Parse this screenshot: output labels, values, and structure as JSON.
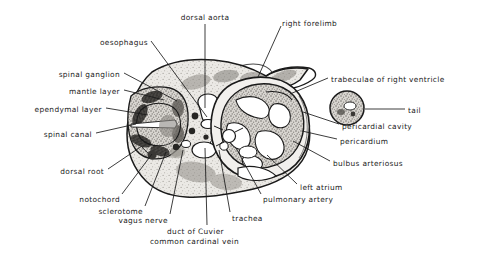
{
  "figure": {
    "kind": "histological cross-section micrograph",
    "background_color": "#ffffff",
    "ink_color": "#1a1a1a",
    "specimen_fill": "#e8e6e2",
    "dark_tissue_color": "#2a2a2a"
  },
  "labels": [
    {
      "id": "dorsal-aorta",
      "text": "dorsal aorta",
      "align": "center",
      "x": 205,
      "y": 14,
      "lx": 205,
      "ly": 24,
      "tx": 205,
      "ty": 108
    },
    {
      "id": "right-forelimb",
      "text": "right forelimb",
      "align": "left",
      "x": 282,
      "y": 20,
      "lx": 281,
      "ly": 26,
      "tx": 258,
      "ty": 77
    },
    {
      "id": "oesophagus",
      "text": "oesophagus",
      "align": "right",
      "x": 148,
      "y": 39,
      "lx": 151,
      "ly": 41,
      "tx": 207,
      "ty": 117
    },
    {
      "id": "trabeculae-of-right-ventricle",
      "text": "trabeculae of right ventricle",
      "align": "left",
      "x": 331,
      "y": 76,
      "lx": 328,
      "ly": 78,
      "tx": 290,
      "ty": 94
    },
    {
      "id": "spinal-ganglion",
      "text": "spinal ganglion",
      "align": "right",
      "x": 120,
      "y": 71,
      "lx": 124,
      "ly": 73,
      "tx": 177,
      "ty": 101
    },
    {
      "id": "mantle-layer",
      "text": "mantle layer",
      "align": "right",
      "x": 120,
      "y": 88,
      "lx": 124,
      "ly": 90,
      "tx": 164,
      "ty": 100
    },
    {
      "id": "ependymal-layer",
      "text": "ependymal layer",
      "align": "right",
      "x": 102,
      "y": 106,
      "lx": 106,
      "ly": 108,
      "tx": 148,
      "ty": 115
    },
    {
      "id": "tail",
      "text": "tail",
      "align": "left",
      "x": 408,
      "y": 107,
      "lx": 405,
      "ly": 109,
      "tx": 365,
      "ty": 109
    },
    {
      "id": "pericardial-cavity",
      "text": "pericardial cavity",
      "align": "left",
      "x": 342,
      "y": 123,
      "lx": 339,
      "ly": 124,
      "tx": 303,
      "ty": 112
    },
    {
      "id": "pericardium",
      "text": "pericardium",
      "align": "left",
      "x": 340,
      "y": 138,
      "lx": 337,
      "ly": 139,
      "tx": 302,
      "ty": 131
    },
    {
      "id": "spinal-canal",
      "text": "spinal canal",
      "align": "right",
      "x": 92,
      "y": 131,
      "lx": 96,
      "ly": 133,
      "tx": 136,
      "ty": 124
    },
    {
      "id": "bulbus-arteriosus",
      "text": "bulbus arteriosus",
      "align": "left",
      "x": 333,
      "y": 160,
      "lx": 330,
      "ly": 161,
      "tx": 293,
      "ty": 141
    },
    {
      "id": "dorsal-root",
      "text": "dorsal root",
      "align": "right",
      "x": 104,
      "y": 168,
      "lx": 108,
      "ly": 169,
      "tx": 142,
      "ty": 146
    },
    {
      "id": "left-atrium",
      "text": "left atrium",
      "align": "left",
      "x": 300,
      "y": 184,
      "lx": 297,
      "ly": 184,
      "tx": 267,
      "ty": 155
    },
    {
      "id": "notochord",
      "text": "notochord",
      "align": "right",
      "x": 120,
      "y": 196,
      "lx": 122,
      "ly": 194,
      "tx": 152,
      "ty": 154
    },
    {
      "id": "pulmonary-artery",
      "text": "pulmonary artery",
      "align": "left",
      "x": 263,
      "y": 196,
      "lx": 261,
      "ly": 194,
      "tx": 236,
      "ty": 148
    },
    {
      "id": "sclerotome",
      "text": "sclerotome",
      "align": "right",
      "x": 143,
      "y": 208,
      "lx": 145,
      "ly": 206,
      "tx": 166,
      "ty": 152
    },
    {
      "id": "vagus-nerve",
      "text": "vagus nerve",
      "align": "right",
      "x": 168,
      "y": 217,
      "lx": 170,
      "ly": 214,
      "tx": 183,
      "ty": 150
    },
    {
      "id": "trachea",
      "text": "trachea",
      "align": "left",
      "x": 232,
      "y": 215,
      "lx": 230,
      "ly": 212,
      "tx": 219,
      "ty": 150
    },
    {
      "id": "duct-of-cuvier",
      "text": "duct of Cuvier",
      "align": "right",
      "x": 224,
      "y": 228,
      "lx": 207,
      "ly": 225,
      "tx": 205,
      "ty": 148
    },
    {
      "id": "common-cardinal-vein",
      "text": "common cardinal vein",
      "align": "right",
      "x": 239,
      "y": 238,
      "lx": null,
      "ly": null,
      "tx": null,
      "ty": null
    }
  ]
}
